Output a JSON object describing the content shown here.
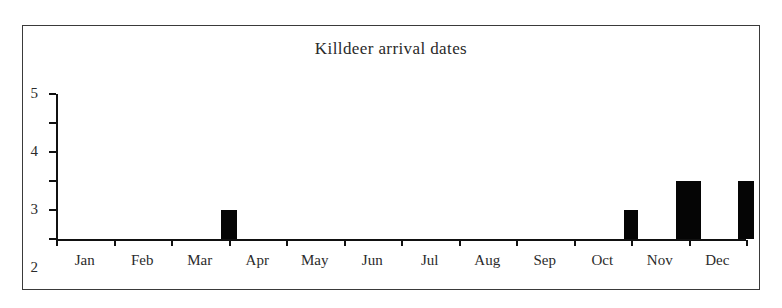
{
  "chart_data": {
    "type": "bar",
    "title": "Killdeer arrival dates",
    "xlabel": "",
    "ylabel": "",
    "categories": [
      "Jan",
      "Feb",
      "Mar",
      "Apr",
      "May",
      "Jun",
      "Jul",
      "Aug",
      "Sep",
      "Oct",
      "Nov",
      "Dec"
    ],
    "values": [
      0,
      0,
      1,
      0,
      0,
      0,
      0,
      0,
      0,
      1,
      2,
      2
    ],
    "ylim": [
      0,
      5
    ],
    "yticks": [
      "0",
      "1",
      "2",
      "3",
      "4",
      "5"
    ],
    "grid": false,
    "legend": false,
    "bar_color": "#050505",
    "axis_color": "#111111",
    "frame_color": "#3a3a3a",
    "background": "#ffffff"
  }
}
